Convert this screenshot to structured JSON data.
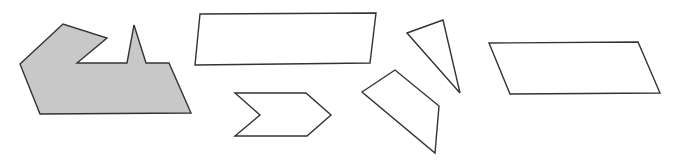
{
  "canvas": {
    "width": 675,
    "height": 164,
    "background": "#ffffff"
  },
  "colors": {
    "stroke": "#333333",
    "shaded_fill": "#c8c8c8",
    "plain_fill": "#ffffff"
  },
  "shapes": [
    {
      "name": "shaded-irregular-polygon",
      "fill": "#c8c8c8",
      "points": "20,64 63,24 107,38 77,63 127,63 134,25 146,63 169,63 191,113 40,114"
    },
    {
      "name": "parallelogram-top",
      "fill": "#ffffff",
      "points": "200,14 376,13 370,63 195,65"
    },
    {
      "name": "chevron-arrow",
      "fill": "#ffffff",
      "points": "235,93 306,93 331,115 307,136 235,136 260,115"
    },
    {
      "name": "triangle",
      "fill": "#ffffff",
      "points": "407,33 443,20 460,93"
    },
    {
      "name": "quadrilateral",
      "fill": "#ffffff",
      "points": "362,92 395,70 439,106 435,153"
    },
    {
      "name": "parallelogram-right",
      "fill": "#ffffff",
      "points": "489,43 638,42 660,93 510,94"
    }
  ]
}
